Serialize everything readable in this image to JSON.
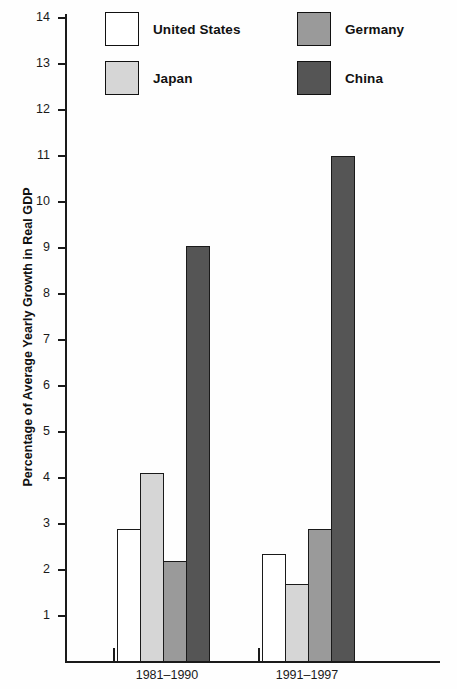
{
  "chart_data": {
    "type": "bar",
    "title": "",
    "xlabel": "",
    "ylabel": "Percentage of Average Yearly Growth in Real GDP",
    "categories": [
      "1981–1990",
      "1991–1997"
    ],
    "series": [
      {
        "name": "United States",
        "values": [
          2.9,
          2.35
        ],
        "color": "#ffffff"
      },
      {
        "name": "Japan",
        "values": [
          4.1,
          1.7
        ],
        "color": "#d6d6d6"
      },
      {
        "name": "Germany",
        "values": [
          2.2,
          2.9
        ],
        "color": "#9a9a9a"
      },
      {
        "name": "China",
        "values": [
          9.05,
          11.0
        ],
        "color": "#555555"
      }
    ],
    "ylim": [
      0,
      15
    ],
    "yticks": [
      15,
      14,
      13,
      12,
      11,
      10,
      9,
      8,
      7,
      6,
      5,
      4,
      3,
      2,
      1
    ],
    "ytick_labels": [
      "15",
      "14",
      "13",
      "12",
      "11",
      "10",
      "9",
      "8",
      "7",
      "6",
      "5",
      "4",
      "3",
      "2",
      "1"
    ],
    "grid": false,
    "legend_position": "top"
  },
  "legend": {
    "items": [
      {
        "label": "United States",
        "swatch": "legend-swatch-united-states"
      },
      {
        "label": "Germany",
        "swatch": "legend-swatch-germany"
      },
      {
        "label": "Japan",
        "swatch": "legend-swatch-japan"
      },
      {
        "label": "China",
        "swatch": "legend-swatch-china"
      }
    ]
  },
  "axis": {
    "y_title": "Percentage of Average Yearly Growth in Real GDP"
  }
}
